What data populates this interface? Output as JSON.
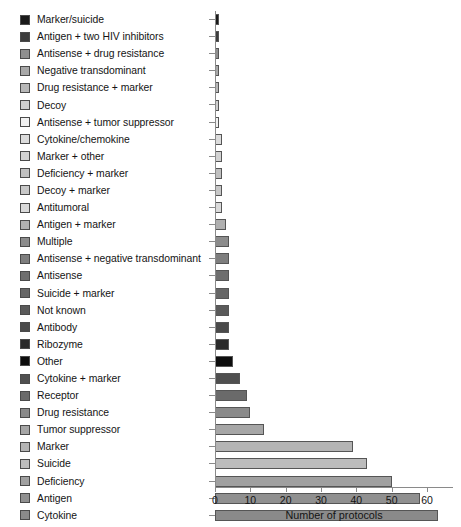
{
  "chart_data": {
    "type": "bar",
    "orientation": "horizontal",
    "title": "",
    "xlabel": "Number of protocols",
    "ylabel": "",
    "xlim": [
      0,
      65
    ],
    "xticks": [
      0,
      10,
      20,
      30,
      40,
      50,
      60
    ],
    "grid": false,
    "legend": "inline-left-swatches",
    "categories": [
      "Marker/suicide",
      "Antigen + two HIV inhibitors",
      "Antisense + drug resistance",
      "Negative transdominant",
      "Drug resistance + marker",
      "Decoy",
      "Antisense + tumor suppressor",
      "Cytokine/chemokine",
      "Marker + other",
      "Deficiency + marker",
      "Decoy + marker",
      "Antitumoral",
      "Antigen + marker",
      "Multiple",
      "Antisense + negative transdominant",
      "Antisense",
      "Suicide + marker",
      "Not known",
      "Antibody",
      "Ribozyme",
      "Other",
      "Cytokine + marker",
      "Receptor",
      "Drug resistance",
      "Tumor suppressor",
      "Marker",
      "Suicide",
      "Deficiency",
      "Antigen",
      "Cytokine"
    ],
    "values": [
      1,
      1,
      1,
      1,
      1,
      1,
      1,
      2,
      2,
      2,
      2,
      2,
      3,
      4,
      4,
      4,
      4,
      4,
      4,
      4,
      5,
      7,
      9,
      10,
      14,
      39,
      43,
      50,
      58,
      63
    ],
    "colors": [
      "#1a1a1a",
      "#3c3c3c",
      "#8f8f8f",
      "#a8a8a8",
      "#b7b7b7",
      "#cfcfcf",
      "#f2f2f2",
      "#dcdcdc",
      "#d2d2d2",
      "#c0c0c0",
      "#c8c8c8",
      "#dadada",
      "#b0b0b0",
      "#8c8c8c",
      "#7e7e7e",
      "#6e6e6e",
      "#666666",
      "#5a5a5a",
      "#4a4a4a",
      "#2a2a2a",
      "#0d0d0d",
      "#4f4f4f",
      "#6a6a6a",
      "#8a8a8a",
      "#a6a6a6",
      "#b4b4b4",
      "#bcbcbc",
      "#a0a0a0",
      "#909090",
      "#8a8a8a"
    ]
  }
}
